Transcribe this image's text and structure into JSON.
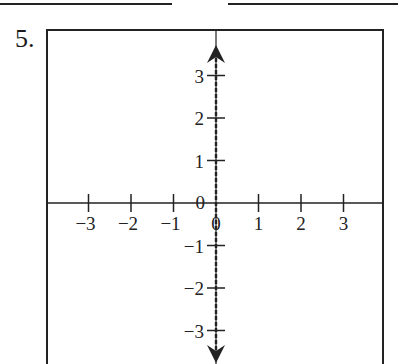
{
  "problem": {
    "number": "5.",
    "answer_lines": [
      {
        "x1": 0,
        "x2": 172
      },
      {
        "x1": 228,
        "x2": 398
      }
    ]
  },
  "graph": {
    "frame": {
      "left": 47,
      "top": 30,
      "right": 383
    },
    "origin": {
      "x": 216,
      "y": 203
    },
    "unit_px": 42.5,
    "x_ticks": [
      {
        "value": -3,
        "label": "−3"
      },
      {
        "value": -2,
        "label": "−2"
      },
      {
        "value": -1,
        "label": "−1"
      },
      {
        "value": 0,
        "label": "0"
      },
      {
        "value": 1,
        "label": "1"
      },
      {
        "value": 2,
        "label": "2"
      },
      {
        "value": 3,
        "label": "3"
      }
    ],
    "y_ticks": [
      {
        "value": 3,
        "label": "3"
      },
      {
        "value": 2,
        "label": "2"
      },
      {
        "value": 1,
        "label": "1"
      },
      {
        "value": 0,
        "label": "0"
      },
      {
        "value": -1,
        "label": "−1"
      },
      {
        "value": -2,
        "label": "−2"
      },
      {
        "value": -3,
        "label": "−3"
      }
    ],
    "dashed_vertical_line": {
      "x": 0,
      "style": "dashed",
      "arrows": "both",
      "description": "graph of x = 0"
    },
    "colors": {
      "line": "#222222",
      "background": "#ffffff"
    }
  }
}
